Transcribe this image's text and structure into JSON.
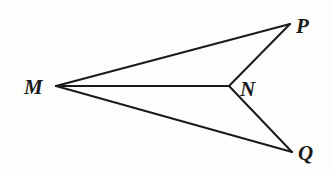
{
  "diagram": {
    "type": "geometry-figure",
    "stroke_color": "#1a1a1a",
    "background_color": "#fdfdfb",
    "points": {
      "M": {
        "label": "M",
        "x": 56,
        "y": 86
      },
      "P": {
        "label": "P",
        "x": 290,
        "y": 24
      },
      "N": {
        "label": "N",
        "x": 229,
        "y": 86
      },
      "Q": {
        "label": "Q",
        "x": 292,
        "y": 152
      }
    },
    "segments": [
      {
        "from": "M",
        "to": "P"
      },
      {
        "from": "P",
        "to": "N"
      },
      {
        "from": "N",
        "to": "Q"
      },
      {
        "from": "Q",
        "to": "M"
      },
      {
        "from": "M",
        "to": "N"
      }
    ]
  }
}
